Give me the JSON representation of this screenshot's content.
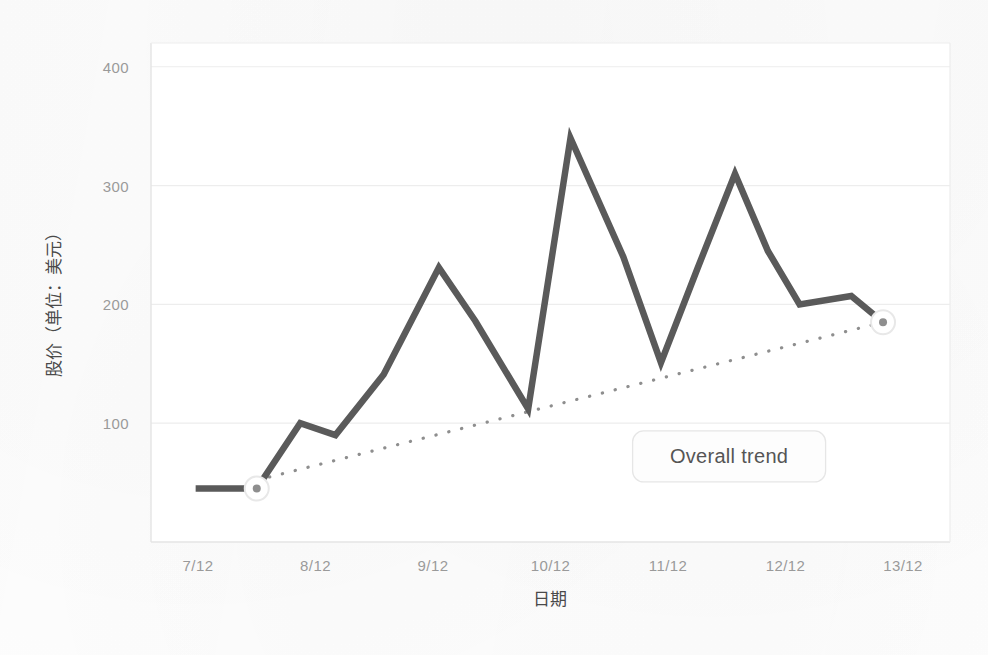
{
  "chart_data": {
    "type": "line",
    "title": "",
    "xlabel": "日期",
    "ylabel": "股价（单位：美元）",
    "xlim": [
      6.6,
      13.4
    ],
    "ylim": [
      0,
      420
    ],
    "grid": true,
    "legend_position": "none",
    "x_tick_labels": [
      "7/12",
      "8/12",
      "9/12",
      "10/12",
      "11/12",
      "12/12",
      "13/12"
    ],
    "x_tick_values": [
      7,
      8,
      9,
      10,
      11,
      12,
      13
    ],
    "y_tick_labels": [
      "100",
      "200",
      "300",
      "400"
    ],
    "y_tick_values": [
      100,
      200,
      300,
      400
    ],
    "series": [
      {
        "name": "股价",
        "style": "solid",
        "color": "#5a5a5a",
        "x": [
          6.98,
          7.5,
          7.87,
          8.17,
          8.58,
          9.05,
          9.36,
          9.81,
          10.17,
          10.62,
          10.94,
          11.25,
          11.57,
          11.85,
          12.12,
          12.56,
          12.83
        ],
        "y": [
          45,
          45,
          100,
          90,
          141,
          231,
          186,
          112,
          340,
          240,
          151,
          230,
          310,
          245,
          200,
          207,
          185
        ]
      },
      {
        "name": "Overall trend",
        "style": "dotted",
        "color": "#8e8e8e",
        "x": [
          7.5,
          12.83
        ],
        "y": [
          52,
          185
        ]
      }
    ],
    "markers": [
      {
        "name": "start-marker",
        "x": 7.5,
        "y": 45
      },
      {
        "name": "end-marker",
        "x": 12.83,
        "y": 185
      }
    ],
    "annotations": [
      {
        "name": "trend-label",
        "text": "Overall trend",
        "x": 11.52,
        "y": 72
      }
    ],
    "colors": {
      "line": "#5a5a5a",
      "trend": "#8e8e8e",
      "grid": "#ededed",
      "axis": "#e4e4e4",
      "tick_text": "#9a9a9a",
      "title_text": "#4a4a4a",
      "annotation_bg": "#fdfdfd",
      "annotation_border": "#e6e6e6",
      "annotation_text": "#555555",
      "marker_fill": "#ffffff",
      "marker_stroke": "#e8e8e8",
      "marker_dot": "#8e8e8e"
    }
  }
}
